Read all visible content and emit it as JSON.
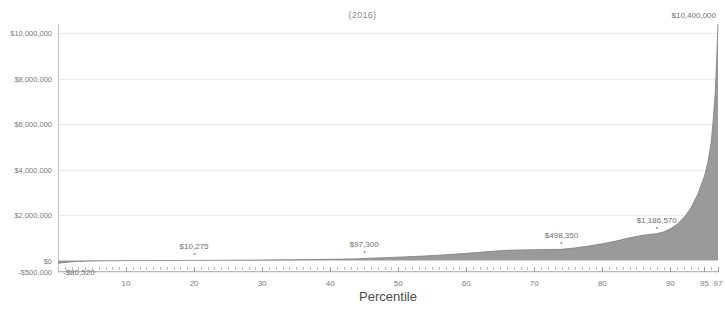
{
  "chart_data": {
    "type": "area",
    "title": "(2016)",
    "xlabel": "Percentile",
    "ylabel": "",
    "grid": true,
    "legend": "none",
    "xlim": [
      0,
      97
    ],
    "ylim": [
      -500000,
      10400000
    ],
    "accent_color": "#9a9a9a",
    "x_ticks": [
      {
        "value": 10,
        "label": "10"
      },
      {
        "value": 20,
        "label": "20"
      },
      {
        "value": 30,
        "label": "30"
      },
      {
        "value": 40,
        "label": "40"
      },
      {
        "value": 50,
        "label": "50"
      },
      {
        "value": 60,
        "label": "60"
      },
      {
        "value": 70,
        "label": "70"
      },
      {
        "value": 80,
        "label": "80"
      },
      {
        "value": 90,
        "label": "90"
      },
      {
        "value": 95,
        "label": "95"
      },
      {
        "value": 97,
        "label": "97"
      }
    ],
    "y_ticks": [
      {
        "value": 10000000,
        "label": "$10,000,000"
      },
      {
        "value": 8000000,
        "label": "$8,000,000"
      },
      {
        "value": 6000000,
        "label": "$6,000,000"
      },
      {
        "value": 4000000,
        "label": "$4,000,000"
      },
      {
        "value": 2000000,
        "label": "$2,000,000"
      },
      {
        "value": 0,
        "label": "$0"
      },
      {
        "value": -500000,
        "label": "-$500,000"
      }
    ],
    "annotations": [
      {
        "x": 1,
        "y": -80520,
        "label": "-$80,520",
        "placement": "below"
      },
      {
        "x": 20,
        "y": 10275,
        "label": "$10,275",
        "placement": "above"
      },
      {
        "x": 45,
        "y": 97300,
        "label": "$97,300",
        "placement": "above"
      },
      {
        "x": 74,
        "y": 498350,
        "label": "$498,350",
        "placement": "above"
      },
      {
        "x": 88,
        "y": 1186570,
        "label": "$1,186,570",
        "placement": "above"
      },
      {
        "x": 97,
        "y": 10400000,
        "label": "$10,400,000",
        "placement": "top"
      }
    ],
    "x": [
      0,
      1,
      2,
      3,
      4,
      5,
      6,
      7,
      8,
      9,
      10,
      12,
      14,
      16,
      18,
      20,
      22,
      24,
      26,
      28,
      30,
      32,
      34,
      36,
      38,
      40,
      42,
      44,
      45,
      46,
      48,
      50,
      52,
      54,
      56,
      58,
      60,
      62,
      64,
      66,
      68,
      70,
      72,
      74,
      76,
      78,
      80,
      82,
      84,
      86,
      88,
      89,
      90,
      91,
      92,
      93,
      94,
      95,
      95.5,
      96,
      96.3,
      96.6,
      96.8,
      97
    ],
    "y": [
      -120000,
      -80520,
      -55000,
      -38000,
      -26000,
      -18000,
      -12000,
      -7500,
      -4000,
      -1500,
      500,
      2200,
      4200,
      6000,
      7800,
      10275,
      13000,
      16000,
      19500,
      23500,
      28000,
      33000,
      38500,
      44500,
      51000,
      58000,
      66000,
      78000,
      97300,
      108000,
      128000,
      152000,
      178000,
      207000,
      240000,
      278000,
      320000,
      366000,
      416000,
      452000,
      470000,
      482000,
      490000,
      498350,
      560000,
      640000,
      740000,
      860000,
      1000000,
      1120000,
      1186570,
      1260000,
      1400000,
      1600000,
      1900000,
      2300000,
      2900000,
      3700000,
      4300000,
      5200000,
      6200000,
      7400000,
      8800000,
      10400000
    ]
  }
}
